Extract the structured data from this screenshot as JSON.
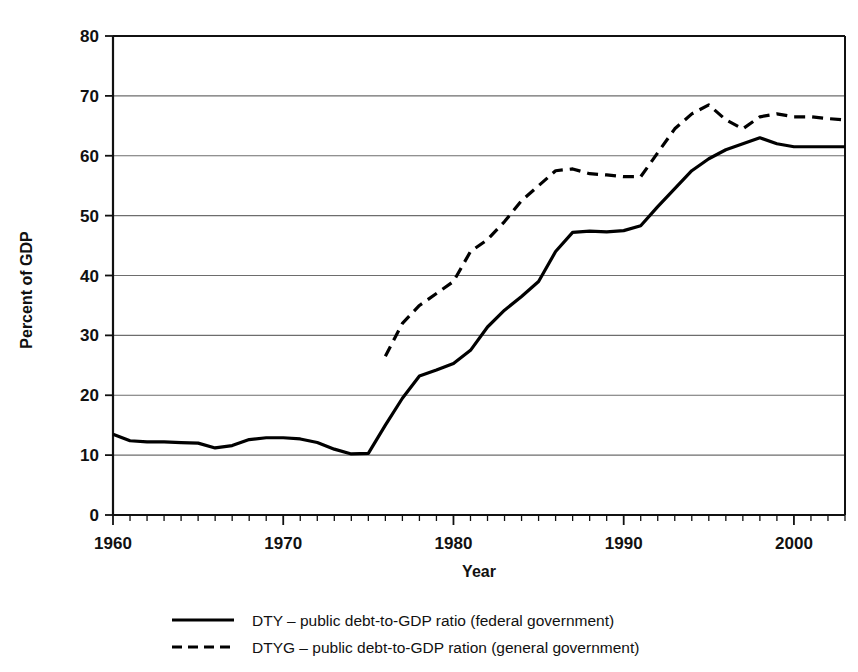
{
  "chart_data": {
    "type": "line",
    "title": "",
    "xlabel": "Year",
    "ylabel": "Percent of GDP",
    "xlim": [
      1960,
      2003
    ],
    "ylim": [
      0,
      80
    ],
    "ytick_values": [
      0,
      10,
      20,
      30,
      40,
      50,
      60,
      70,
      80
    ],
    "ytick_labels": [
      "0",
      "10",
      "20",
      "30",
      "40",
      "50",
      "60",
      "70",
      "80"
    ],
    "xtick_values": [
      1960,
      1970,
      1980,
      1990,
      2000
    ],
    "xtick_labels": [
      "1960",
      "1970",
      "1980",
      "1990",
      "2000"
    ],
    "xtick_minor_step": 1,
    "grid": "horizontal",
    "legend_position": "below",
    "series": [
      {
        "name": "DTY",
        "label": "DTY – public debt-to-GDP ratio (federal government)",
        "style": "solid",
        "color": "#000000",
        "x": [
          1960,
          1961,
          1962,
          1963,
          1964,
          1965,
          1966,
          1967,
          1968,
          1969,
          1970,
          1971,
          1972,
          1973,
          1974,
          1975,
          1976,
          1977,
          1978,
          1979,
          1980,
          1981,
          1982,
          1983,
          1984,
          1985,
          1986,
          1987,
          1988,
          1989,
          1990,
          1991,
          1992,
          1993,
          1994,
          1995,
          1996,
          1997,
          1998,
          1999,
          2000,
          2001,
          2002,
          2003
        ],
        "y": [
          13.5,
          12.4,
          12.2,
          12.2,
          12.1,
          12.0,
          11.2,
          11.6,
          12.6,
          12.9,
          12.9,
          12.7,
          12.1,
          11.0,
          10.2,
          10.3,
          15.0,
          19.5,
          23.2,
          24.2,
          25.3,
          27.5,
          31.4,
          34.2,
          36.5,
          39.0,
          44.0,
          47.2,
          47.4,
          47.3,
          47.5,
          48.3,
          51.5,
          54.5,
          57.5,
          59.5,
          61.0,
          62.0,
          63.0,
          62.0,
          61.5,
          61.5,
          61.5,
          61.5
        ]
      },
      {
        "name": "DTYG",
        "label": "DTYG – public debt-to-GDP ration (general government)",
        "style": "dashed",
        "color": "#000000",
        "x": [
          1976,
          1977,
          1978,
          1979,
          1980,
          1981,
          1982,
          1983,
          1984,
          1985,
          1986,
          1987,
          1988,
          1989,
          1990,
          1991,
          1992,
          1993,
          1994,
          1995,
          1996,
          1997,
          1998,
          1999,
          2000,
          2001,
          2002,
          2003
        ],
        "y": [
          26.5,
          32.0,
          35.0,
          37.0,
          39.0,
          44.0,
          46.0,
          49.0,
          52.5,
          55.0,
          57.5,
          57.8,
          57.0,
          56.8,
          56.5,
          56.5,
          60.5,
          64.5,
          67.0,
          68.5,
          66.0,
          64.5,
          66.5,
          67.0,
          66.5,
          66.5,
          66.2,
          66.0
        ]
      }
    ]
  }
}
